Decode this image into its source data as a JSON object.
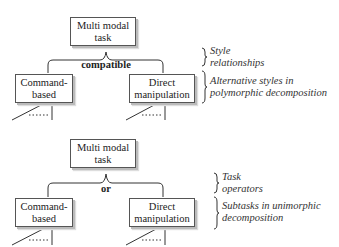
{
  "diagrams": [
    {
      "root": "Multi modal\ntask",
      "operator": "compatible",
      "children": [
        "Command-\nbased",
        "Direct\nmanipulation"
      ],
      "annotations": [
        "Style\nrelationships",
        "Alternative styles in\npolymorphic decomposition"
      ]
    },
    {
      "root": "Multi modal\ntask",
      "operator": "or",
      "children": [
        "Command-\nbased",
        "Direct\nmanipulation"
      ],
      "annotations": [
        "Task\noperators",
        "Subtasks in unimorphic\ndecomposition"
      ]
    }
  ]
}
